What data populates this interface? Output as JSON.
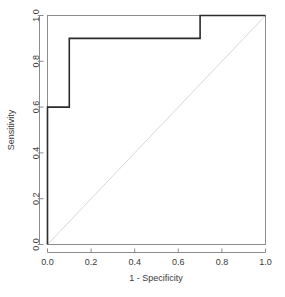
{
  "figure": {
    "name": "roc-curve-plot",
    "background_color": "#ffffff"
  },
  "chart_data": {
    "type": "line",
    "title": "",
    "subtitle": "",
    "xlabel": "1 - Specificity",
    "ylabel": "Sensitivity",
    "xlim": [
      0.0,
      1.0
    ],
    "ylim": [
      0.0,
      1.0
    ],
    "grid": false,
    "legend": false,
    "legend_position": "none",
    "xticks": [
      "0.0",
      "0.2",
      "0.4",
      "0.6",
      "0.8",
      "1.0"
    ],
    "xtick_values": [
      0.0,
      0.2,
      0.4,
      0.6,
      0.8,
      1.0
    ],
    "yticks": [
      "0.0",
      "0.2",
      "0.4",
      "0.6",
      "0.8",
      "1.0"
    ],
    "ytick_values": [
      0.0,
      0.2,
      0.4,
      0.6,
      0.8,
      1.0
    ],
    "series": [
      {
        "name": "roc-curve",
        "style": "step",
        "color": "#2b2b2b",
        "linewidth": 1.6,
        "x": [
          0.0,
          0.0,
          0.1,
          0.1,
          0.7,
          0.7,
          1.0
        ],
        "y": [
          0.0,
          0.6,
          0.6,
          0.9,
          0.9,
          1.0,
          1.0
        ]
      },
      {
        "name": "chance-diagonal",
        "style": "line",
        "color": "#d8d8d8",
        "linewidth": 1.0,
        "x": [
          0.0,
          1.0
        ],
        "y": [
          0.0,
          1.0
        ]
      }
    ]
  },
  "axes": {
    "box_color": "#8c8c8c",
    "tick_color": "#8c8c8c",
    "x_title": "1 - Specificity",
    "y_title": "Sensitivity"
  }
}
